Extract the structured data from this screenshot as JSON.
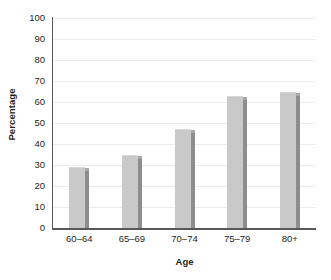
{
  "chart_data": {
    "type": "bar",
    "title": "",
    "subtitle": "",
    "xlabel": "Age",
    "ylabel": "Percentage",
    "categories": [
      "60–64",
      "65–69",
      "70–74",
      "75–79",
      "80+"
    ],
    "values": [
      28.5,
      34.5,
      46.5,
      62.5,
      64.5
    ],
    "series": [
      {
        "name": "Percentage",
        "values": [
          28.5,
          34.5,
          46.5,
          62.5,
          64.5
        ]
      }
    ],
    "ylim": [
      0,
      100
    ],
    "yticks": [
      0,
      10,
      20,
      30,
      40,
      50,
      60,
      70,
      80,
      90,
      100
    ],
    "ytick_labels": [
      "0",
      "10",
      "20",
      "30",
      "40",
      "50",
      "60",
      "70",
      "80",
      "90",
      "100"
    ],
    "grid": true,
    "grid_axis": "y",
    "legend": false,
    "legend_position": "none",
    "annotations": [],
    "colors": {
      "bar_face": "#c9c9c9",
      "bar_shadow": "#8d8d8d",
      "gridline": "#ececec",
      "axis_line": "#58585a",
      "text": "#231f20",
      "background": "#ffffff"
    }
  }
}
